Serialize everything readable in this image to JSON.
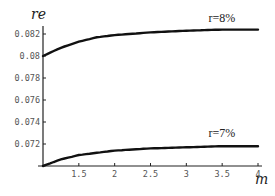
{
  "chart_data": {
    "type": "line",
    "title": "",
    "xlabel": "m",
    "ylabel": "re",
    "xlim": [
      1,
      4
    ],
    "ylim": [
      0.07,
      0.083
    ],
    "x_ticks": [
      1.5,
      2,
      2.5,
      3,
      3.5,
      4
    ],
    "x_tick_labels": [
      "1.5",
      "2",
      "2.5",
      "3",
      "3.5",
      "4"
    ],
    "y_ticks": [
      0.072,
      0.074,
      0.076,
      0.078,
      0.08,
      0.082
    ],
    "y_tick_labels": [
      "0.072",
      "0.074",
      "0.076",
      "0.078",
      "0.08",
      "0.082"
    ],
    "grid": false,
    "legend_position": "inline labels above curves",
    "x": [
      1,
      1.25,
      1.5,
      1.75,
      2,
      2.5,
      3,
      3.5,
      4
    ],
    "series": [
      {
        "name": "r=8%",
        "values": [
          0.08,
          0.08075,
          0.0813,
          0.0817,
          0.0819,
          0.08215,
          0.0823,
          0.0824,
          0.0824
        ]
      },
      {
        "name": "r=7%",
        "values": [
          0.07,
          0.0706,
          0.071,
          0.0712,
          0.0714,
          0.0716,
          0.0717,
          0.0718,
          0.0718
        ]
      }
    ]
  }
}
